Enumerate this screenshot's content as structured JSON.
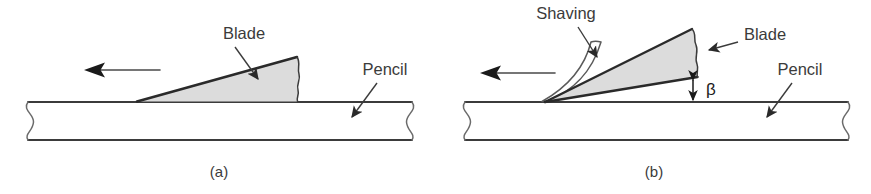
{
  "figure": {
    "type": "technical-line-diagram",
    "panels": [
      {
        "id": "a",
        "caption": "(a)",
        "labels": {
          "blade": "Blade",
          "pencil": "Pencil"
        },
        "icons": {
          "motion_arrow": "left-arrow-icon",
          "blade_leader": "leader-arrow-icon",
          "pencil_leader": "leader-arrow-icon",
          "break_left": "break-line-icon",
          "break_right": "break-line-icon",
          "blade_break": "wavy-break-icon"
        }
      },
      {
        "id": "b",
        "caption": "(b)",
        "labels": {
          "shaving": "Shaving",
          "blade": "Blade",
          "pencil": "Pencil",
          "angle": "β"
        },
        "icons": {
          "motion_arrow": "left-arrow-icon",
          "shaving_leader": "leader-arrow-icon",
          "blade_leader": "leader-arrow-icon",
          "pencil_leader": "leader-arrow-icon",
          "angle_dimension": "double-headed-arrow-icon",
          "break_left": "break-line-icon",
          "break_right": "break-line-icon",
          "blade_break": "wavy-break-icon"
        }
      }
    ],
    "colors": {
      "stroke": "#3b3b3b",
      "stroke_dark": "#2a2a2a",
      "blade_fill": "#dcdcdc",
      "pencil_fill": "#ffffff",
      "background": "#ffffff",
      "text": "#3b3b3b"
    }
  }
}
